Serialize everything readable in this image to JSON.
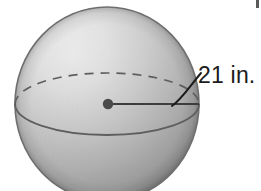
{
  "figure": {
    "kind": "sphere-radius-diagram",
    "background_color": "#ffffff"
  },
  "sphere": {
    "center_x": 107,
    "center_y": 104,
    "radius_x": 92,
    "radius_y": 97,
    "outline_color": "#6f6f6f",
    "fill_light": "#f2f2f2",
    "fill_mid": "#c3c3c3",
    "fill_dark": "#9a9a9a",
    "fill_edge": "#868686"
  },
  "equator": {
    "back_arc_style": "dashed",
    "front_arc_style": "solid",
    "arc_color": "#5e5e5e",
    "ellipse_ry": 31
  },
  "center_point": {
    "label": "center-dot",
    "x": 108,
    "y": 104,
    "radius": 5,
    "color": "#4a4a4a"
  },
  "radius_segment": {
    "label": "radius-line",
    "from_x": 108,
    "from_y": 104,
    "to_x": 199,
    "to_y": 104,
    "color": "#3d3d3d"
  },
  "leader_line": {
    "label": "leader-curve",
    "color": "#1c1c1c",
    "from_x": 175,
    "from_y": 104,
    "to_x": 200,
    "to_y": 74
  },
  "dimension": {
    "value": "21",
    "unit": "in.",
    "text": "21 in.",
    "color": "#1c1c1c"
  },
  "artifact": {
    "present": true,
    "location": "top-right-corner",
    "color": "#5a5a5a"
  }
}
